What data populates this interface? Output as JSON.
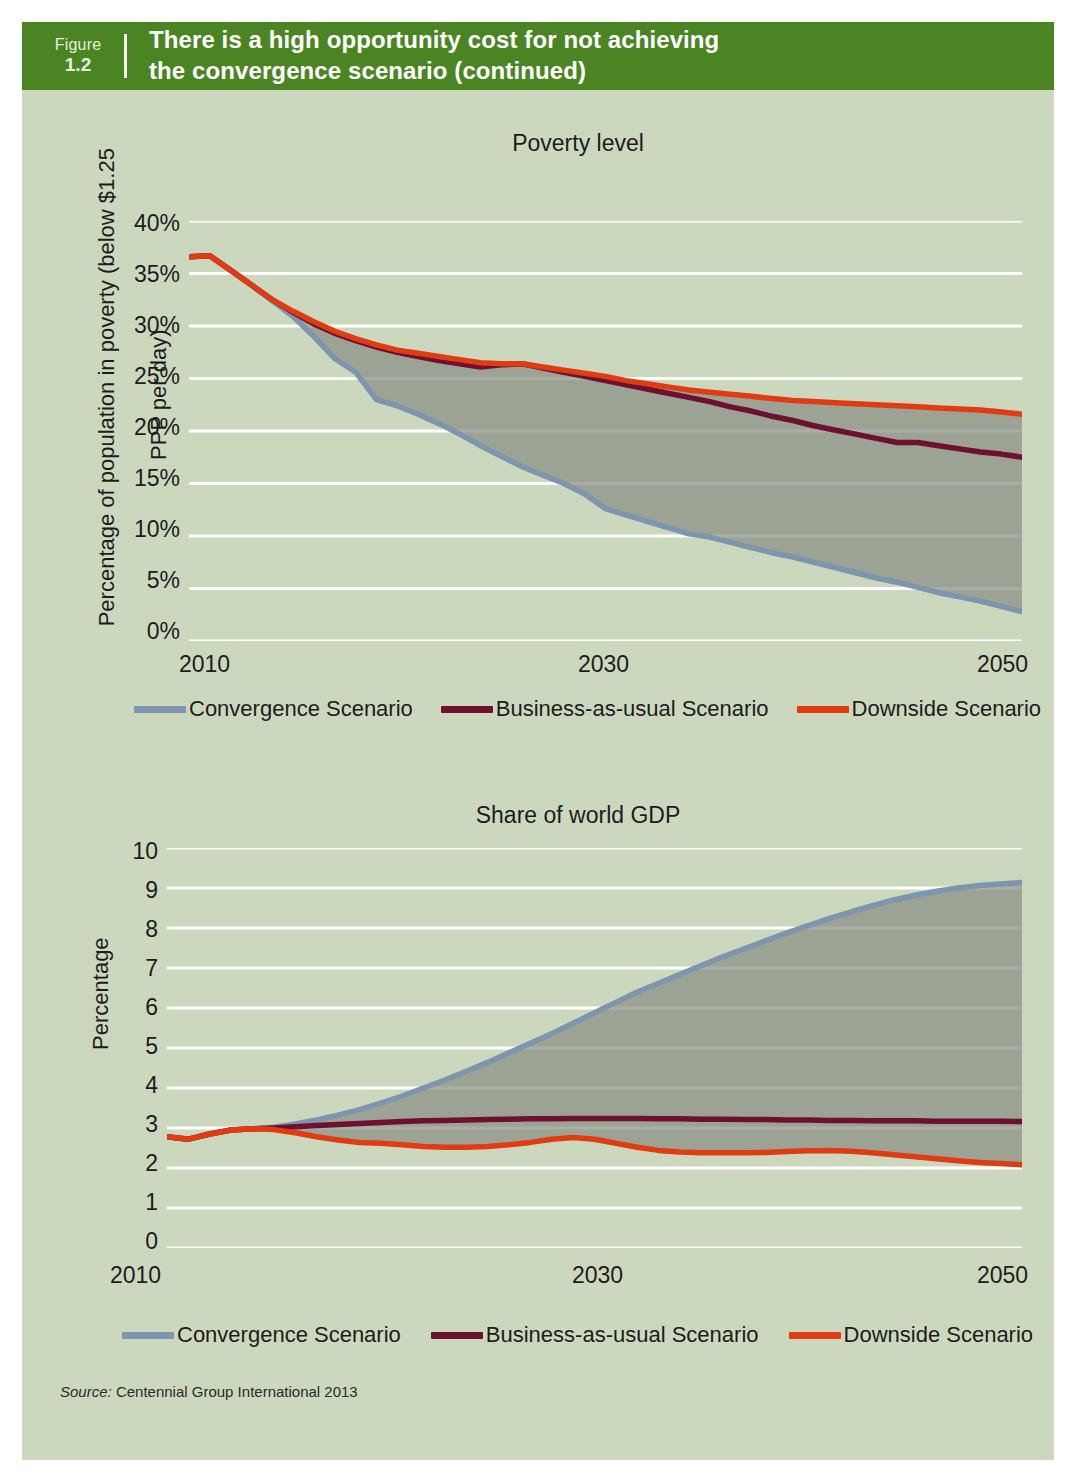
{
  "banner": {
    "figure_word": "Figure",
    "figure_number": "1.2",
    "title_line1": "There is a high opportunity cost for not achieving",
    "title_line2": "the convergence scenario (continued)",
    "background_color": "#4b8423",
    "text_color": "#ffffff"
  },
  "page": {
    "background_color": "#ccd8bd",
    "gridline_color": "#ffffff",
    "band_fill_color": "#8b8f83"
  },
  "source": {
    "label": "Source:",
    "text": "Centennial Group International 2013"
  },
  "legend": {
    "items": [
      {
        "label": "Convergence Scenario",
        "color": "#7d96ad"
      },
      {
        "label": "Business-as-usual Scenario",
        "color": "#6e1130"
      },
      {
        "label": "Downside Scenario",
        "color": "#e03c13"
      }
    ]
  },
  "chart_data": [
    {
      "type": "line",
      "id": "poverty-level",
      "title": "Poverty level",
      "xlabel": "",
      "ylabel": "Percentage of population in poverty (below $1.25\nPPP per day)",
      "ylabel_line1": "Percentage of population in poverty (below $1.25",
      "ylabel_line2": "PPP per day)",
      "ylim": [
        0,
        40
      ],
      "ytick_labels": [
        "40%",
        "35%",
        "30%",
        "25%",
        "20%",
        "15%",
        "10%",
        "5%",
        "0%"
      ],
      "ytick_values": [
        40,
        35,
        30,
        25,
        20,
        15,
        10,
        5,
        0
      ],
      "xlim": [
        2010,
        2050
      ],
      "xtick_labels": [
        "2010",
        "2030",
        "2050"
      ],
      "xtick_values": [
        2010,
        2030,
        2050
      ],
      "grid": true,
      "legend_position": "below",
      "x": [
        2010,
        2011,
        2012,
        2013,
        2014,
        2015,
        2016,
        2017,
        2018,
        2019,
        2020,
        2021,
        2022,
        2023,
        2024,
        2025,
        2026,
        2027,
        2028,
        2029,
        2030,
        2031,
        2032,
        2033,
        2034,
        2035,
        2036,
        2037,
        2038,
        2039,
        2040,
        2041,
        2042,
        2043,
        2044,
        2045,
        2046,
        2047,
        2048,
        2049,
        2050
      ],
      "series": [
        {
          "name": "Convergence Scenario",
          "color": "#7d96ad",
          "values": [
            36.6,
            36.7,
            35.3,
            33.9,
            32.4,
            30.9,
            29.0,
            26.9,
            25.6,
            23.0,
            22.4,
            21.6,
            20.7,
            19.7,
            18.6,
            17.6,
            16.6,
            15.8,
            15.0,
            14.0,
            12.6,
            12.0,
            11.4,
            10.8,
            10.2,
            9.9,
            9.4,
            8.9,
            8.4,
            8.0,
            7.5,
            7.0,
            6.5,
            6.0,
            5.6,
            5.1,
            4.6,
            4.2,
            3.8,
            3.3,
            2.8
          ]
        },
        {
          "name": "Business-as-usual Scenario",
          "color": "#6e1130",
          "values": [
            36.6,
            36.7,
            35.3,
            33.9,
            32.5,
            31.3,
            30.2,
            29.3,
            28.6,
            28.0,
            27.5,
            27.1,
            26.7,
            26.4,
            26.1,
            26.3,
            26.4,
            26.0,
            25.6,
            25.2,
            24.8,
            24.4,
            24.0,
            23.6,
            23.2,
            22.8,
            22.3,
            21.9,
            21.4,
            21.0,
            20.5,
            20.1,
            19.7,
            19.3,
            18.9,
            18.9,
            18.6,
            18.3,
            18.0,
            17.8,
            17.5
          ]
        },
        {
          "name": "Downside Scenario",
          "color": "#e03c13",
          "values": [
            36.6,
            36.7,
            35.3,
            33.9,
            32.5,
            31.4,
            30.4,
            29.5,
            28.8,
            28.2,
            27.7,
            27.4,
            27.1,
            26.8,
            26.5,
            26.4,
            26.4,
            26.1,
            25.8,
            25.5,
            25.2,
            24.8,
            24.5,
            24.2,
            23.9,
            23.7,
            23.5,
            23.3,
            23.1,
            22.9,
            22.8,
            22.7,
            22.6,
            22.5,
            22.4,
            22.3,
            22.2,
            22.1,
            22.0,
            21.8,
            21.6
          ]
        }
      ]
    },
    {
      "type": "line",
      "id": "share-of-world-gdp",
      "title": "Share of world GDP",
      "xlabel": "",
      "ylabel": "Percentage",
      "ylim": [
        0,
        10
      ],
      "ytick_labels": [
        "10",
        "9",
        "8",
        "7",
        "6",
        "5",
        "4",
        "3",
        "2",
        "1",
        "0"
      ],
      "ytick_values": [
        10,
        9,
        8,
        7,
        6,
        5,
        4,
        3,
        2,
        1,
        0
      ],
      "xlim": [
        2010,
        2050
      ],
      "xtick_labels": [
        "2010",
        "2030",
        "2050"
      ],
      "xtick_values": [
        2010,
        2030,
        2050
      ],
      "grid": true,
      "legend_position": "below",
      "x": [
        2010,
        2011,
        2012,
        2013,
        2014,
        2015,
        2016,
        2017,
        2018,
        2019,
        2020,
        2021,
        2022,
        2023,
        2024,
        2025,
        2026,
        2027,
        2028,
        2029,
        2030,
        2031,
        2032,
        2033,
        2034,
        2035,
        2036,
        2037,
        2038,
        2039,
        2040,
        2041,
        2042,
        2043,
        2044,
        2045,
        2046,
        2047,
        2048,
        2049,
        2050
      ],
      "series": [
        {
          "name": "Convergence Scenario",
          "color": "#7d96ad",
          "values": [
            2.78,
            2.72,
            2.85,
            2.95,
            2.98,
            3.02,
            3.1,
            3.2,
            3.32,
            3.46,
            3.62,
            3.8,
            4.0,
            4.2,
            4.42,
            4.64,
            4.88,
            5.12,
            5.36,
            5.62,
            5.88,
            6.14,
            6.4,
            6.62,
            6.84,
            7.06,
            7.28,
            7.48,
            7.68,
            7.88,
            8.06,
            8.24,
            8.4,
            8.56,
            8.7,
            8.82,
            8.92,
            9.0,
            9.06,
            9.1,
            9.14
          ]
        },
        {
          "name": "Business-as-usual Scenario",
          "color": "#6e1130",
          "values": [
            2.78,
            2.72,
            2.85,
            2.95,
            2.98,
            3.0,
            3.03,
            3.06,
            3.09,
            3.11,
            3.14,
            3.16,
            3.18,
            3.19,
            3.2,
            3.21,
            3.22,
            3.23,
            3.23,
            3.24,
            3.24,
            3.24,
            3.24,
            3.23,
            3.23,
            3.22,
            3.22,
            3.21,
            3.21,
            3.2,
            3.2,
            3.19,
            3.19,
            3.18,
            3.18,
            3.18,
            3.17,
            3.17,
            3.17,
            3.17,
            3.16
          ]
        },
        {
          "name": "Downside Scenario",
          "color": "#e03c13",
          "values": [
            2.78,
            2.72,
            2.85,
            2.95,
            2.98,
            2.96,
            2.88,
            2.78,
            2.7,
            2.64,
            2.62,
            2.58,
            2.54,
            2.52,
            2.52,
            2.54,
            2.58,
            2.64,
            2.72,
            2.76,
            2.72,
            2.62,
            2.52,
            2.44,
            2.4,
            2.38,
            2.38,
            2.38,
            2.39,
            2.41,
            2.43,
            2.44,
            2.42,
            2.38,
            2.33,
            2.28,
            2.23,
            2.18,
            2.14,
            2.11,
            2.08
          ]
        }
      ]
    }
  ]
}
